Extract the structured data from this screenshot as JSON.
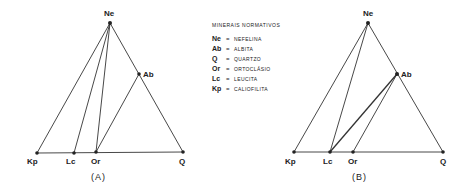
{
  "legend": {
    "title": "MINERAIS NORMATIVOS",
    "items": [
      {
        "abbr": "Ne",
        "eq": "=",
        "name": "NEFELINA"
      },
      {
        "abbr": "Ab",
        "eq": "=",
        "name": "ALBITA"
      },
      {
        "abbr": "Q",
        "eq": "=",
        "name": "QUARTZO"
      },
      {
        "abbr": "Or",
        "eq": "=",
        "name": "ORTOCLÁSIO"
      },
      {
        "abbr": "Lc",
        "eq": "=",
        "name": "LEUCITA"
      },
      {
        "abbr": "Kp",
        "eq": "=",
        "name": "CALIOFILITA"
      }
    ]
  },
  "diagrams": [
    {
      "caption": "(A)",
      "labels": {
        "Ne": "Ne",
        "Ab": "Ab",
        "Kp": "Kp",
        "Lc": "Lc",
        "Or": "Or",
        "Q": "Q"
      }
    },
    {
      "caption": "(B)",
      "labels": {
        "Ne": "Ne",
        "Ab": "Ab",
        "Kp": "Kp",
        "Lc": "Lc",
        "Or": "Or",
        "Q": "Q"
      }
    }
  ]
}
